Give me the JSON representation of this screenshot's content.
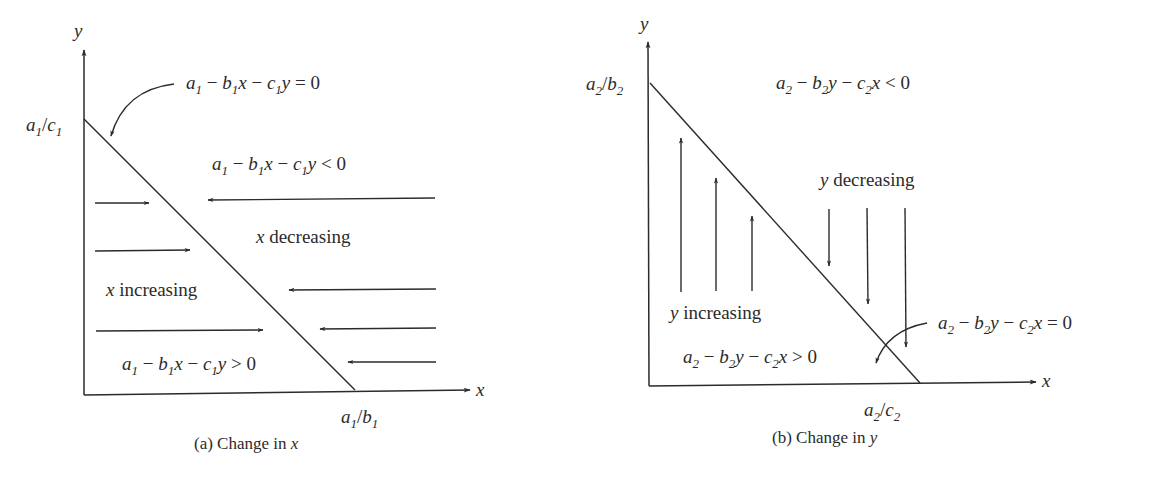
{
  "figure": {
    "panels": [
      {
        "id": "a",
        "caption_prefix": "(a) Change in ",
        "caption_var": "x",
        "axis_x_label": "x",
        "axis_y_label": "y",
        "y_intercept": {
          "a": "a",
          "a_sub": "1",
          "slash": "/",
          "c": "c",
          "c_sub": "1"
        },
        "x_intercept": {
          "a": "a",
          "a_sub": "1",
          "slash": "/",
          "b": "b",
          "b_sub": "1"
        },
        "nullcline_label": {
          "text": "a1 − b1x − c1y = 0"
        },
        "region_above": {
          "text": "a1 − b1x − c1y < 0",
          "trend_var": "x",
          "trend": " decreasing"
        },
        "region_below": {
          "text": "a1 − b1x − c1y > 0",
          "trend_var": "x",
          "trend": " increasing"
        },
        "arrows_right": 3,
        "arrows_left": 4
      },
      {
        "id": "b",
        "caption_prefix": "(b) Change in ",
        "caption_var": "y",
        "axis_x_label": "x",
        "axis_y_label": "y",
        "y_intercept": {
          "a": "a",
          "a_sub": "2",
          "slash": "/",
          "b": "b",
          "b_sub": "2"
        },
        "x_intercept": {
          "a": "a",
          "a_sub": "2",
          "slash": "/",
          "c": "c",
          "c_sub": "2"
        },
        "nullcline_label": {
          "text": "a2 − b2y − c2x = 0"
        },
        "region_above": {
          "text": "a2 − b2y − c2x < 0",
          "trend_var": "y",
          "trend": " decreasing"
        },
        "region_below": {
          "text": "a2 − b2y − c2x > 0",
          "trend_var": "y",
          "trend": " increasing"
        },
        "arrows_up": 3,
        "arrows_down": 3
      }
    ],
    "symbols": {
      "minus": " − ",
      "eq": " = 0",
      "lt": " < 0",
      "gt": " > 0",
      "a": "a",
      "b": "b",
      "c": "c",
      "x": "x",
      "y": "y",
      "one": "1",
      "two": "2"
    }
  }
}
